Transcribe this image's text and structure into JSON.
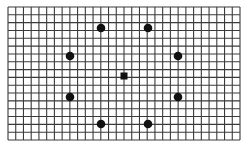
{
  "canvas": {
    "width": 248,
    "height": 151,
    "background": "#ffffff"
  },
  "grid": {
    "x0": 8,
    "y0": 7,
    "x1": 240,
    "y1": 140,
    "columns": 30,
    "rows": 17,
    "line_color": "#3a3a3a",
    "line_width": 1.1
  },
  "center_marker": {
    "shape": "square",
    "cx": 124,
    "cy": 76,
    "size": 7,
    "color": "#111111"
  },
  "dots": [
    {
      "id": "top-left",
      "cx": 101,
      "cy": 28,
      "r": 4.3
    },
    {
      "id": "top-right",
      "cx": 148,
      "cy": 28,
      "r": 4.3
    },
    {
      "id": "upper-left",
      "cx": 70,
      "cy": 56,
      "r": 4.3
    },
    {
      "id": "upper-right",
      "cx": 178,
      "cy": 56,
      "r": 4.3
    },
    {
      "id": "lower-left",
      "cx": 70,
      "cy": 97,
      "r": 4.3
    },
    {
      "id": "lower-right",
      "cx": 178,
      "cy": 97,
      "r": 4.3
    },
    {
      "id": "bottom-left",
      "cx": 101,
      "cy": 124,
      "r": 4.3
    },
    {
      "id": "bottom-right",
      "cx": 148,
      "cy": 124,
      "r": 4.3
    }
  ],
  "dot_color": "#111111"
}
